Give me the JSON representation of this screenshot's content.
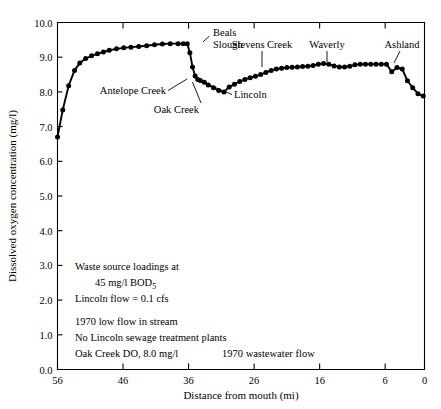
{
  "chart_data": {
    "type": "line",
    "title": "",
    "xlabel": "Distance from mouth (mi)",
    "ylabel": "Dissolved oxygen concentration (mg/l)",
    "xlim": [
      56,
      0
    ],
    "ylim": [
      0.0,
      10.0
    ],
    "x_ticks": [
      56,
      46,
      36,
      26,
      16,
      6,
      0
    ],
    "x_ticklabels": [
      "56",
      "46",
      "36",
      "26",
      "16",
      "6",
      "0"
    ],
    "y_ticks": [
      0.0,
      1.0,
      2.0,
      3.0,
      4.0,
      5.0,
      6.0,
      7.0,
      8.0,
      9.0,
      10.0
    ],
    "y_ticklabels": [
      "0.0",
      "1.0",
      "2.0",
      "3.0",
      "4.0",
      "5.0",
      "6.0",
      "7.0",
      "8.0",
      "9.0",
      "10.0"
    ],
    "grid": false,
    "legend": "none",
    "marker": "filled-circle",
    "series": [
      {
        "name": "Dissolved oxygen",
        "x": [
          56.0,
          55.2,
          54.3,
          53.4,
          52.6,
          51.7,
          50.8,
          49.9,
          49.0,
          48.1,
          47.0,
          45.9,
          44.8,
          43.6,
          42.4,
          41.2,
          40.0,
          38.8,
          37.6,
          36.8,
          36.2,
          35.8,
          35.4,
          35.0,
          34.6,
          34.2,
          33.6,
          33.0,
          32.2,
          31.4,
          30.6,
          29.8,
          29.0,
          28.2,
          27.4,
          26.6,
          25.8,
          25.0,
          24.2,
          23.4,
          22.6,
          21.8,
          21.0,
          20.2,
          19.4,
          18.6,
          17.8,
          17.0,
          16.2,
          15.4,
          14.6,
          13.8,
          13.0,
          12.2,
          11.4,
          10.6,
          9.8,
          9.0,
          8.2,
          7.4,
          6.6,
          5.8,
          5.0,
          4.2,
          3.4,
          2.6,
          1.8,
          1.0,
          0.2
        ],
        "y": [
          6.7,
          7.48,
          8.18,
          8.62,
          8.83,
          8.96,
          9.04,
          9.1,
          9.15,
          9.2,
          9.24,
          9.27,
          9.29,
          9.31,
          9.33,
          9.36,
          9.38,
          9.39,
          9.39,
          9.39,
          9.39,
          9.13,
          8.72,
          8.46,
          8.36,
          8.33,
          8.28,
          8.2,
          8.12,
          8.04,
          8.0,
          8.14,
          8.22,
          8.3,
          8.36,
          8.41,
          8.45,
          8.5,
          8.56,
          8.62,
          8.66,
          8.68,
          8.7,
          8.71,
          8.72,
          8.73,
          8.74,
          8.76,
          8.8,
          8.82,
          8.8,
          8.75,
          8.72,
          8.72,
          8.74,
          8.78,
          8.8,
          8.8,
          8.8,
          8.8,
          8.8,
          8.8,
          8.58,
          8.7,
          8.66,
          8.32,
          8.12,
          7.95,
          7.88
        ]
      }
    ],
    "annotations": [
      {
        "label": "Beals\nSlough",
        "point_x": 37.0,
        "point_y": 9.39
      },
      {
        "label": "Antelope Creek",
        "point_x": 31.4,
        "point_y": 8.04
      },
      {
        "label": "Oak Creek",
        "point_x": 30.6,
        "point_y": 8.0
      },
      {
        "label": "Lincoln",
        "point_x": 29.8,
        "point_y": 8.14
      },
      {
        "label": "Stevens Creek",
        "point_x": 25.0,
        "point_y": 8.5
      },
      {
        "label": "Waverly",
        "point_x": 16.5,
        "point_y": 8.79
      },
      {
        "label": "Ashland",
        "point_x": 5.2,
        "point_y": 8.62
      }
    ],
    "notes": [
      "Waste source loadings at",
      "45 mg/l BOD₅",
      "Lincoln flow = 0.1 cfs",
      "1970 low flow in stream",
      "No Lincoln sewage treatment plants",
      "Oak Creek DO, 8.0 mg/l",
      "1970 wastewater flow"
    ]
  },
  "annotation_labels": {
    "beals_line1": "Beals",
    "beals_line2": "Slough",
    "antelope": "Antelope Creek",
    "oak": "Oak Creek",
    "lincoln": "Lincoln",
    "stevens": "Stevens Creek",
    "waverly": "Waverly",
    "ashland": "Ashland"
  },
  "notes_block": {
    "l1": "Waste source loadings at",
    "l2a": "45 mg/l BOD",
    "l2b": "5",
    "l3": "Lincoln flow = 0.1 cfs",
    "l4": "1970 low flow in stream",
    "l5": "No Lincoln sewage treatment plants",
    "l6": "Oak Creek DO, 8.0 mg/l",
    "l7": "1970 wastewater flow"
  },
  "axes": {
    "x_title": "Distance from mouth (mi)",
    "y_title": "Dissolved oxygen concentration (mg/l)",
    "x0": "56",
    "x1": "46",
    "x2": "36",
    "x3": "26",
    "x4": "16",
    "x5": "6",
    "x6": "0",
    "y0": "0.0",
    "y1": "1.0",
    "y2": "2.0",
    "y3": "3.0",
    "y4": "4.0",
    "y5": "5.0",
    "y6": "6.0",
    "y7": "7.0",
    "y8": "8.0",
    "y9": "9.0",
    "y10": "10.0"
  }
}
